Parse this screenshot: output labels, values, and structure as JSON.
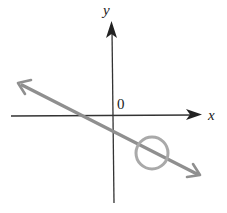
{
  "figure": {
    "axes": {
      "x_label": "x",
      "y_label": "y",
      "origin_label": "0"
    },
    "line": {
      "slope": "negative",
      "color": "#8f8f8f"
    },
    "highlight_circle": {
      "quadrant": "IV",
      "color": "#a9a9a9"
    },
    "axis_color": "#222222"
  }
}
